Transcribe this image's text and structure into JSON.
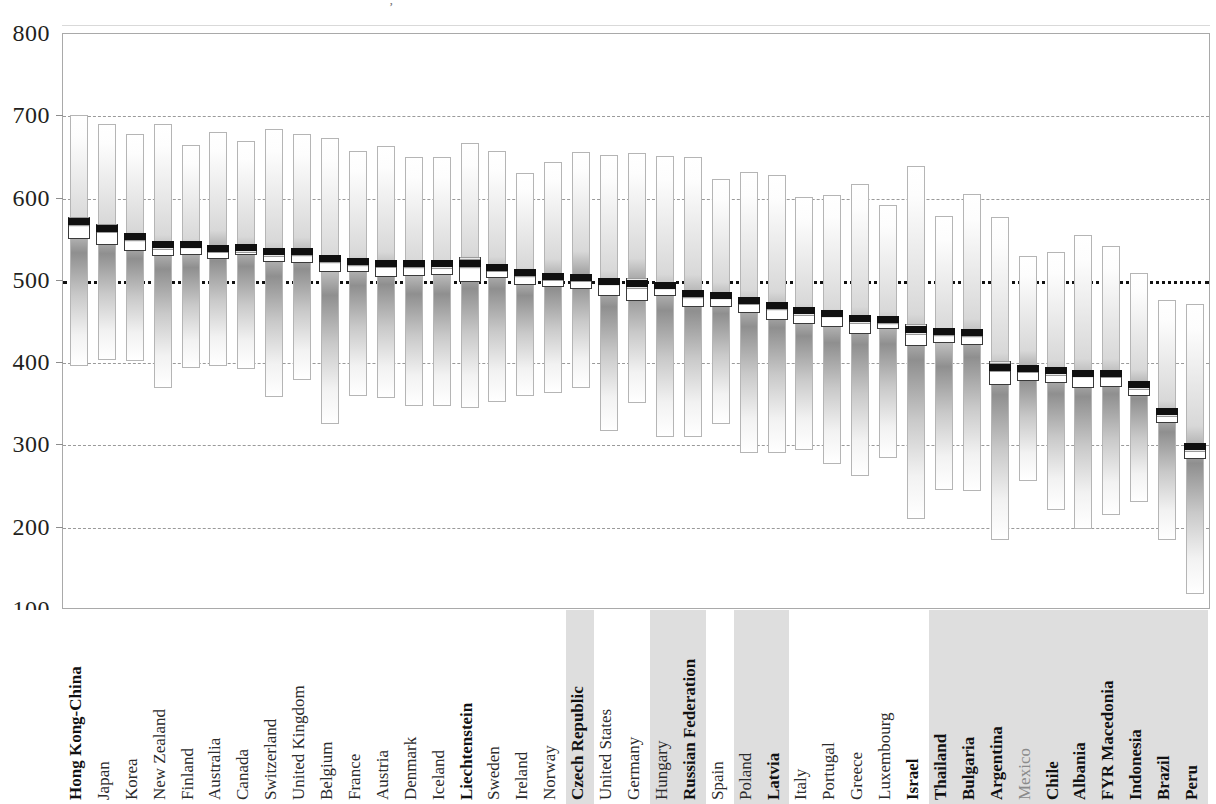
{
  "figure": {
    "title_fragment": "’",
    "axis_label": "",
    "reference_line_value": 500,
    "reference_line_note": "OECD average"
  },
  "chart_data": {
    "type": "bar",
    "subtype": "range-bar-with-mean-and-confidence-interval",
    "title": "",
    "xlabel": "",
    "ylabel": "",
    "ylim": [
      100,
      800
    ],
    "yticks": [
      100,
      200,
      300,
      400,
      500,
      600,
      700,
      800
    ],
    "grid": true,
    "gridlines_at": [
      200,
      300,
      400,
      500,
      600,
      700
    ],
    "reference_line": 500,
    "legend": [],
    "categories": [
      "Hong Kong-China",
      "Japan",
      "Korea",
      "New Zealand",
      "Finland",
      "Australia",
      "Canada",
      "Switzerland",
      "United Kingdom",
      "Belgium",
      "France",
      "Austria",
      "Denmark",
      "Iceland",
      "Liechtenstein",
      "Sweden",
      "Ireland",
      "Norway",
      "Czech Republic",
      "United States",
      "Germany",
      "Hungary",
      "Russian Federation",
      "Spain",
      "Poland",
      "Latvia",
      "Italy",
      "Portugal",
      "Greece",
      "Luxembourg",
      "Israel",
      "Thailand",
      "Bulgaria",
      "Argentina",
      "Mexico",
      "Chile",
      "Albania",
      "FYR Macedonia",
      "Indonesia",
      "Brazil",
      "Peru"
    ],
    "series": [
      {
        "name": "5th percentile",
        "values": [
          397,
          404,
          403,
          370,
          394,
          396,
          393,
          359,
          379,
          326,
          360,
          358,
          348,
          348,
          346,
          353,
          360,
          364,
          370,
          318,
          351,
          310,
          310,
          326,
          291,
          291,
          295,
          277,
          263,
          285,
          211,
          246,
          245,
          185,
          257,
          222,
          199,
          216,
          231,
          185,
          120
        ]
      },
      {
        "name": "95th percentile",
        "values": [
          702,
          691,
          678,
          691,
          665,
          681,
          670,
          684,
          678,
          674,
          658,
          664,
          651,
          651,
          667,
          658,
          631,
          645,
          657,
          653,
          655,
          652,
          651,
          624,
          632,
          629,
          602,
          604,
          618,
          592,
          640,
          579,
          606,
          578,
          530,
          535,
          556,
          542,
          510,
          477,
          472
        ]
      },
      {
        "name": "mean score",
        "values": [
          565,
          557,
          547,
          537,
          538,
          533,
          534,
          529,
          529,
          520,
          517,
          515,
          514,
          514,
          514,
          510,
          503,
          499,
          498,
          493,
          490,
          488,
          478,
          476,
          470,
          463,
          457,
          454,
          447,
          446,
          434,
          432,
          430,
          388,
          387,
          384,
          381,
          381,
          367,
          334,
          292
        ]
      },
      {
        "name": "confidence interval lower",
        "values": [
          551,
          544,
          536,
          530,
          532,
          526,
          531,
          523,
          522,
          511,
          511,
          505,
          506,
          507,
          498,
          503,
          495,
          492,
          490,
          482,
          476,
          481,
          468,
          468,
          461,
          453,
          448,
          444,
          436,
          441,
          421,
          425,
          422,
          374,
          378,
          376,
          370,
          371,
          360,
          327,
          284
        ]
      },
      {
        "name": "confidence interval upper",
        "values": [
          577,
          569,
          557,
          544,
          544,
          540,
          538,
          535,
          536,
          528,
          524,
          524,
          522,
          521,
          529,
          517,
          511,
          506,
          507,
          504,
          503,
          496,
          488,
          484,
          479,
          473,
          466,
          464,
          458,
          451,
          447,
          439,
          438,
          402,
          396,
          393,
          392,
          390,
          374,
          341,
          300
        ]
      }
    ],
    "highlighted_categories": [
      "Hong Kong-China",
      "Liechtenstein",
      "Czech Republic",
      "Russian Federation",
      "Latvia",
      "Israel",
      "Thailand",
      "Bulgaria",
      "Argentina",
      "Chile",
      "Albania",
      "FYR Macedonia",
      "Indonesia",
      "Brazil",
      "Peru"
    ],
    "faint_categories": [
      "Mexico"
    ],
    "shaded_label_bands": [
      [
        "Czech Republic",
        "Czech Republic"
      ],
      [
        "Hungary",
        "Russian Federation"
      ],
      [
        "Poland",
        "Latvia"
      ],
      [
        "Thailand",
        "Peru"
      ]
    ]
  },
  "colors": {
    "axis": "#8d8d8d",
    "gridline": "#9a9a9a",
    "reference_line": "#111111",
    "bar_outline": "#b5b5b5",
    "mean_marker": "#101010",
    "ci_outline": "#3a3a3a",
    "label_band": "#c9c9c9",
    "text": "#231f20"
  }
}
